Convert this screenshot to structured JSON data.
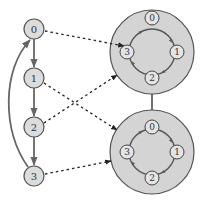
{
  "diagram": {
    "type": "graph-mapping",
    "colors": {
      "background": "#ffffff",
      "node_fill": "#dcdcdc",
      "node_stroke": "#555555",
      "cluster_fill": "#d4d4d4",
      "cluster_stroke": "#555555",
      "edge": "#666666",
      "dashed_edge": "#333333",
      "text": "#333333"
    },
    "left_chain": {
      "nodes": [
        {
          "id": "0",
          "label": "0",
          "cx": 34,
          "cy": 29
        },
        {
          "id": "1",
          "label": "1",
          "cx": 34,
          "cy": 78
        },
        {
          "id": "2",
          "label": "2",
          "cx": 34,
          "cy": 127
        },
        {
          "id": "3",
          "label": "3",
          "cx": 34,
          "cy": 176
        }
      ],
      "edges": [
        {
          "from": "0",
          "to": "1"
        },
        {
          "from": "1",
          "to": "2"
        },
        {
          "from": "2",
          "to": "3"
        },
        {
          "from": "3",
          "to": "0",
          "curved": true
        }
      ]
    },
    "clusters": [
      {
        "id": "top",
        "cx": 152,
        "cy": 52,
        "r": 42,
        "ring_nodes": [
          {
            "label": "0",
            "position": "top"
          },
          {
            "label": "1",
            "position": "right"
          },
          {
            "label": "2",
            "position": "bottom"
          },
          {
            "label": "3",
            "position": "left"
          }
        ],
        "ring_direction": "clockwise 0→1→2→3→0"
      },
      {
        "id": "bottom",
        "cx": 152,
        "cy": 152,
        "r": 42,
        "ring_nodes": [
          {
            "label": "0",
            "position": "top"
          },
          {
            "label": "1",
            "position": "right"
          },
          {
            "label": "2",
            "position": "bottom"
          },
          {
            "label": "3",
            "position": "left"
          }
        ],
        "ring_direction": "clockwise 0→1→2→3→0"
      }
    ],
    "cluster_link": {
      "from": "top",
      "to": "bottom",
      "style": "solid"
    },
    "mappings": [
      {
        "from": "0",
        "to": "top",
        "style": "dashed"
      },
      {
        "from": "1",
        "to": "bottom",
        "style": "dashed"
      },
      {
        "from": "2",
        "to": "top",
        "style": "dashed"
      },
      {
        "from": "3",
        "to": "bottom",
        "style": "dashed"
      }
    ]
  }
}
